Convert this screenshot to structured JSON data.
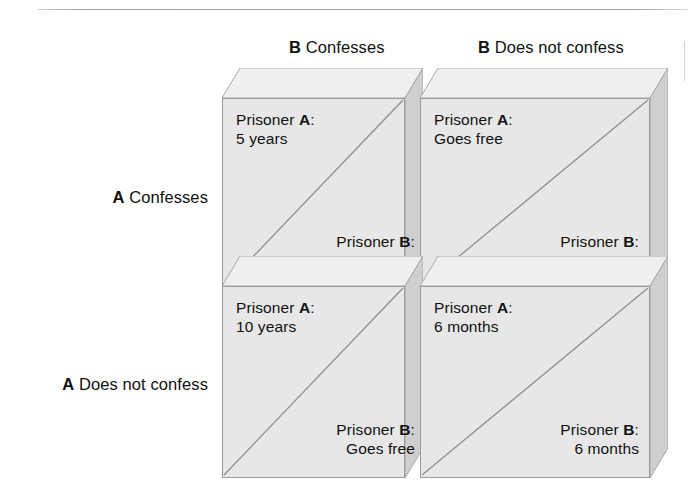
{
  "figure": {
    "type": "payoff-matrix",
    "actor_a": "A",
    "actor_b": "B"
  },
  "columns": [
    {
      "actor": "B",
      "label": "Confesses"
    },
    {
      "actor": "B",
      "label": "Does not confess"
    }
  ],
  "rows": [
    {
      "actor": "A",
      "label": "Confesses"
    },
    {
      "actor": "A",
      "label": "Does not confess"
    }
  ],
  "cells": [
    {
      "row": 0,
      "col": 0,
      "a_name": "Prisoner",
      "a_actor": "A",
      "a_sep": ":",
      "a_payoff": "5 years",
      "b_name": "Prisoner",
      "b_actor": "B",
      "b_sep": ":",
      "b_payoff": "5 years"
    },
    {
      "row": 0,
      "col": 1,
      "a_name": "Prisoner",
      "a_actor": "A",
      "a_sep": ":",
      "a_payoff": "Goes free",
      "b_name": "Prisoner",
      "b_actor": "B",
      "b_sep": ":",
      "b_payoff": "10 years"
    },
    {
      "row": 1,
      "col": 0,
      "a_name": "Prisoner",
      "a_actor": "A",
      "a_sep": ":",
      "a_payoff": "10 years",
      "b_name": "Prisoner",
      "b_actor": "B",
      "b_sep": ":",
      "b_payoff": "Goes free"
    },
    {
      "row": 1,
      "col": 1,
      "a_name": "Prisoner",
      "a_actor": "A",
      "a_sep": ":",
      "a_payoff": "6 months",
      "b_name": "Prisoner",
      "b_actor": "B",
      "b_sep": ":",
      "b_payoff": "6 months"
    }
  ],
  "colors": {
    "face": "#e7e7e7",
    "top_bevel": "#efefef",
    "side_bevel": "#c4c4c4",
    "outline": "#9a9a9a",
    "diagonal": "#8e8e8e",
    "rule": "#a0a0a0",
    "text": "#111111",
    "page": "#ffffff"
  }
}
